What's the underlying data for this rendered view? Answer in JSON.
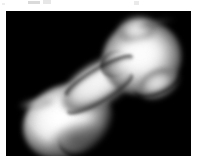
{
  "page": {
    "background_color": "#ffffff",
    "width": 198,
    "height": 161
  },
  "figure": {
    "name": "asteroid-radar-image",
    "plate": {
      "x": 6,
      "y": 11,
      "width": 185,
      "height": 145,
      "background_color": "#000000"
    },
    "orientation": "long axis running lower-left to upper-right",
    "palette": {
      "background": "#000000",
      "highlight": "#ffffff",
      "midtone": "#c3c3c3",
      "shadow": "#4d4d4d"
    },
    "features": [
      {
        "name": "lower-left-lobe",
        "description": "large bright rounded lobe"
      },
      {
        "name": "upper-right-lobe",
        "description": "rounded head lobe with small top knob"
      },
      {
        "name": "neck",
        "description": "narrow waist joining the two lobes"
      },
      {
        "name": "neck-groove",
        "description": "dark seam line along the waist"
      },
      {
        "name": "left-spur",
        "description": "faint wispy protrusion off the far left limb"
      },
      {
        "name": "top-dark-streak",
        "description": "faint dark wisp above the head lobe"
      },
      {
        "name": "base-crease",
        "description": "curved dark crease at the lobe base"
      }
    ]
  },
  "artifacts": {
    "top_edge_marks": "faint cropped ink marks along the top page margin"
  }
}
